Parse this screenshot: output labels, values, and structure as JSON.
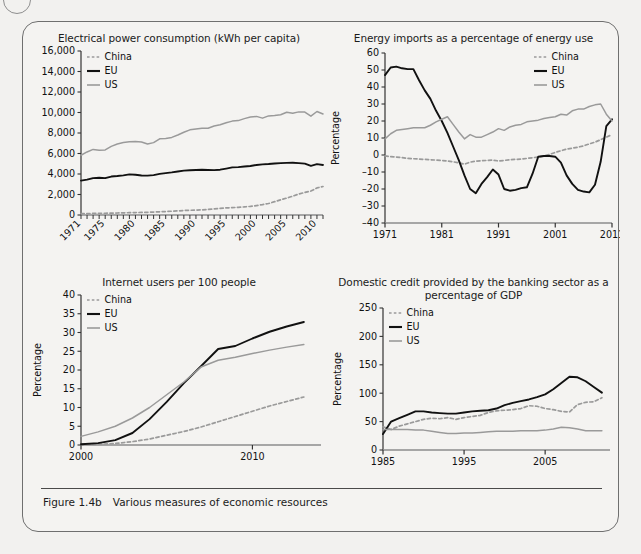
{
  "figure": {
    "caption_number": "Figure 1.4b",
    "caption_text": "Various measures of economic resources"
  },
  "series_colors": {
    "China": "#9a9a9a",
    "EU": "#111111",
    "US": "#9a9a9a"
  },
  "legend_labels": [
    "China",
    "EU",
    "US"
  ],
  "chart_data": [
    {
      "id": "electrical-power-consumption",
      "type": "line",
      "title": "Electrical power consumption (kWh per capita)",
      "xlabel": "",
      "ylabel": "",
      "xlim": [
        1971,
        2011
      ],
      "ylim": [
        0,
        16000
      ],
      "yticks": [
        0,
        2000,
        4000,
        6000,
        8000,
        10000,
        12000,
        14000,
        16000
      ],
      "ytick_labels": [
        "0",
        "2,000",
        "4,000",
        "6,000",
        "8,000",
        "10,000",
        "12,000",
        "14,000",
        "16,000"
      ],
      "xticks": [
        1971,
        1975,
        1980,
        1985,
        1990,
        1995,
        2000,
        2005,
        2010
      ],
      "xtick_labels": [
        "1971",
        "1975",
        "1980",
        "1985",
        "1990",
        "1995",
        "2000",
        "2005",
        "2010"
      ],
      "xtick_rotated": true,
      "grid": false,
      "legend_position": "top-left",
      "x": [
        1971,
        1972,
        1973,
        1974,
        1975,
        1976,
        1977,
        1978,
        1979,
        1980,
        1981,
        1982,
        1983,
        1984,
        1985,
        1986,
        1987,
        1988,
        1989,
        1990,
        1991,
        1992,
        1993,
        1994,
        1995,
        1996,
        1997,
        1998,
        1999,
        2000,
        2001,
        2002,
        2003,
        2004,
        2005,
        2006,
        2007,
        2008,
        2009,
        2010,
        2011
      ],
      "series": [
        {
          "name": "China",
          "values": [
            130,
            140,
            150,
            160,
            170,
            180,
            195,
            210,
            225,
            240,
            250,
            265,
            285,
            310,
            340,
            370,
            400,
            440,
            460,
            480,
            500,
            540,
            590,
            640,
            690,
            720,
            750,
            790,
            840,
            920,
            1010,
            1120,
            1300,
            1480,
            1650,
            1840,
            2050,
            2200,
            2340,
            2640,
            2780
          ]
        },
        {
          "name": "EU",
          "values": [
            3350,
            3450,
            3600,
            3640,
            3600,
            3750,
            3800,
            3870,
            3960,
            3930,
            3850,
            3840,
            3890,
            4010,
            4090,
            4160,
            4250,
            4330,
            4360,
            4390,
            4410,
            4390,
            4380,
            4420,
            4530,
            4650,
            4670,
            4730,
            4780,
            4880,
            4940,
            4970,
            5020,
            5060,
            5090,
            5100,
            5060,
            5010,
            4790,
            4960,
            4880
          ]
        },
        {
          "name": "US",
          "values": [
            5830,
            6150,
            6400,
            6320,
            6350,
            6700,
            6930,
            7080,
            7140,
            7160,
            7130,
            6930,
            7060,
            7430,
            7470,
            7570,
            7800,
            8070,
            8310,
            8390,
            8460,
            8470,
            8680,
            8800,
            9000,
            9160,
            9210,
            9400,
            9560,
            9620,
            9450,
            9670,
            9700,
            9780,
            10030,
            9930,
            10060,
            10040,
            9640,
            10100,
            9850
          ]
        }
      ]
    },
    {
      "id": "energy-imports-pct",
      "type": "line",
      "title": "Energy imports as a percentage of energy use",
      "xlabel": "",
      "ylabel": "Percentage",
      "xlim": [
        1971,
        2011
      ],
      "ylim": [
        -40,
        60
      ],
      "yticks": [
        -40,
        -30,
        -20,
        -10,
        0,
        10,
        20,
        30,
        40,
        50,
        60
      ],
      "ytick_labels": [
        "–40",
        "–30",
        "–20",
        "–10",
        "0",
        "10",
        "20",
        "30",
        "40",
        "50",
        "60"
      ],
      "xticks": [
        1971,
        1981,
        1991,
        2001,
        2011
      ],
      "xtick_labels": [
        "1971",
        "1981",
        "1991",
        "2001",
        "2011"
      ],
      "grid": false,
      "legend_position": "top-right",
      "x": [
        1971,
        1972,
        1973,
        1974,
        1975,
        1976,
        1977,
        1978,
        1979,
        1980,
        1981,
        1982,
        1983,
        1984,
        1985,
        1986,
        1987,
        1988,
        1989,
        1990,
        1991,
        1992,
        1993,
        1994,
        1995,
        1996,
        1997,
        1998,
        1999,
        2000,
        2001,
        2002,
        2003,
        2004,
        2005,
        2006,
        2007,
        2008,
        2009,
        2010,
        2011
      ],
      "series": [
        {
          "name": "China",
          "values": [
            -0.5,
            -1,
            -1.2,
            -1.5,
            -2,
            -2.2,
            -2.4,
            -2.6,
            -2.8,
            -3,
            -3.2,
            -3.5,
            -4,
            -4.6,
            -5.4,
            -4.2,
            -3.6,
            -3.4,
            -3.2,
            -3,
            -3.5,
            -3.2,
            -2.8,
            -2.6,
            -2.4,
            -2,
            -1.6,
            -1.2,
            -0.6,
            0.4,
            1.5,
            2.5,
            3.5,
            4,
            4.6,
            5.4,
            6.5,
            7.6,
            9,
            10.5,
            12
          ]
        },
        {
          "name": "EU",
          "values": [
            47,
            51.5,
            52,
            51,
            50.5,
            50.5,
            44,
            38,
            33,
            26,
            20,
            13,
            5,
            -3,
            -12,
            -20,
            -22.5,
            -17,
            -13,
            -8.5,
            -11.5,
            -20,
            -21,
            -20.5,
            -19.5,
            -19,
            -11,
            -1,
            -0.6,
            -0.6,
            -1,
            -4.5,
            -12,
            -17,
            -20.5,
            -21.5,
            -22,
            -24,
            -26,
            -24,
            -21.5
          ]
        },
        {
          "name": "US",
          "values": [
            9.5,
            12.5,
            14.5,
            15,
            15.5,
            16,
            16,
            16,
            17.5,
            19.5,
            21,
            22.5,
            18,
            13.5,
            9.5,
            12,
            10.5,
            10.5,
            12,
            13.5,
            15.5,
            14.5,
            16.5,
            17.5,
            18,
            19.5,
            20,
            20.5,
            21.5,
            22,
            22.5,
            24,
            23.5,
            26,
            27,
            27,
            28.5,
            29.5,
            30,
            29.5,
            29.5
          ]
        }
      ],
      "series_tail_overrides": {
        "EU": {
          "2008": -17.5,
          "2009": -4,
          "2010": 17,
          "2011": 21
        },
        "US": {
          "2010": 24,
          "2011": 20
        }
      }
    },
    {
      "id": "internet-users-per-100",
      "type": "line",
      "title": "Internet users per 100 people",
      "xlabel": "",
      "ylabel": "Percentage",
      "xlim": [
        2000,
        2014
      ],
      "ylim": [
        0,
        40
      ],
      "yticks": [
        0,
        5,
        10,
        15,
        20,
        25,
        30,
        35,
        40
      ],
      "ytick_labels": [
        "0",
        "5",
        "10",
        "15",
        "20",
        "25",
        "30",
        "35",
        "40"
      ],
      "xticks": [
        2000,
        2010
      ],
      "xtick_labels": [
        "2000",
        "2010"
      ],
      "grid": false,
      "legend_position": "top-left",
      "x": [
        2000,
        2001,
        2002,
        2003,
        2004,
        2005,
        2006,
        2007,
        2008,
        2009,
        2010,
        2011,
        2012,
        2013
      ],
      "series": [
        {
          "name": "China",
          "values": [
            0.1,
            0.2,
            0.4,
            0.9,
            1.6,
            2.6,
            3.6,
            4.8,
            6.2,
            7.6,
            9,
            10.4,
            11.6,
            12.8
          ]
        },
        {
          "name": "EU",
          "values": [
            0.2,
            0.5,
            1.3,
            3.2,
            6.9,
            11.5,
            16.5,
            21,
            25.6,
            26.4,
            28.4,
            30.2,
            31.6,
            32.8
          ]
        },
        {
          "name": "US",
          "values": [
            2.3,
            3.5,
            5,
            7.2,
            10,
            13.4,
            16.8,
            20.8,
            22.6,
            23.4,
            24.4,
            25.3,
            26.1,
            26.8
          ]
        }
      ]
    },
    {
      "id": "domestic-credit-pct-gdp",
      "type": "line",
      "title": "Domestic credit provided by the banking sector as a percentage of GDP",
      "xlabel": "",
      "ylabel": "Percentage",
      "xlim": [
        1985,
        2013
      ],
      "ylim": [
        0,
        250
      ],
      "yticks": [
        0,
        50,
        100,
        150,
        200,
        250
      ],
      "ytick_labels": [
        "0",
        "50",
        "100",
        "150",
        "200",
        "250"
      ],
      "xticks": [
        1985,
        1995,
        2005
      ],
      "xtick_labels": [
        "1985",
        "1995",
        "2005"
      ],
      "grid": false,
      "legend_position": "top-left",
      "x": [
        1985,
        1986,
        1987,
        1988,
        1989,
        1990,
        1991,
        1992,
        1993,
        1994,
        1995,
        1996,
        1997,
        1998,
        1999,
        2000,
        2001,
        2002,
        2003,
        2004,
        2005,
        2006,
        2007,
        2008,
        2009,
        2010,
        2011,
        2012
      ],
      "series": [
        {
          "name": "China",
          "values": [
            41,
            36,
            42,
            46,
            50,
            54,
            56,
            55,
            57,
            54,
            57,
            59,
            61,
            66,
            69,
            70,
            71,
            73,
            78,
            77,
            73,
            71,
            68,
            67,
            80,
            84,
            85,
            92
          ]
        },
        {
          "name": "EU",
          "values": [
            28,
            50,
            56,
            62,
            68,
            68,
            66,
            65,
            64,
            64,
            66,
            68,
            69,
            70,
            73,
            79,
            83,
            86,
            89,
            93,
            98,
            107,
            118,
            129,
            128,
            121,
            111,
            101
          ]
        },
        {
          "name": "US",
          "values": [
            36,
            36,
            36,
            36,
            35,
            35,
            33,
            31,
            29,
            29,
            30,
            30,
            31,
            32,
            33,
            33,
            33,
            34,
            34,
            34,
            35,
            37,
            40,
            39,
            37,
            34,
            34,
            34
          ]
        }
      ]
    }
  ]
}
